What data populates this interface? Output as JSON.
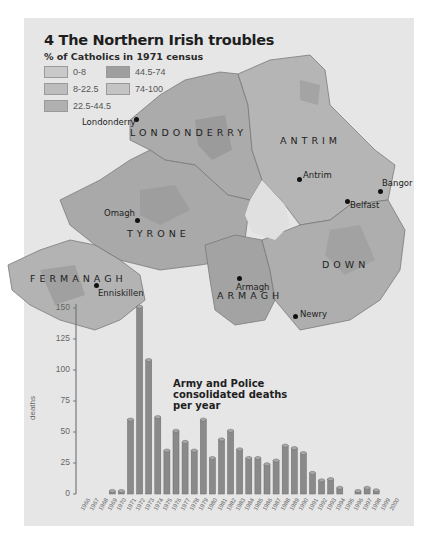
{
  "header": {
    "title": "4 The Northern Irish troubles",
    "subtitle": "% of Catholics in 1971 census"
  },
  "legend": [
    {
      "label": "0-8",
      "color": "#c9c9c9"
    },
    {
      "label": "8-22.5",
      "color": "#bdbdbd"
    },
    {
      "label": "22.5-44.5",
      "color": "#b0b0b0"
    },
    {
      "label": "44.5-74",
      "color": "#9f9f9f"
    },
    {
      "label": "74-100",
      "color": "#c4c4c4"
    }
  ],
  "map": {
    "counties": [
      "LONDONDERRY",
      "ANTRIM",
      "TYRONE",
      "FERMANAGH",
      "ARMAGH",
      "DOWN"
    ],
    "towns": [
      "Londonderry",
      "Antrim",
      "Bangor",
      "Belfast",
      "Omagh",
      "Enniskillen",
      "Armagh",
      "Newry"
    ]
  },
  "chart_data": {
    "type": "bar",
    "title": "Army and Police consolidated deaths per year",
    "xlabel": "",
    "ylabel": "deaths",
    "ylim": [
      0,
      150
    ],
    "yticks": [
      0,
      25,
      50,
      75,
      100,
      125,
      150
    ],
    "grid": false,
    "categories": [
      "1966",
      "1967",
      "1968",
      "1969",
      "1970",
      "1971",
      "1972",
      "1973",
      "1974",
      "1975",
      "1976",
      "1977",
      "1978",
      "1979",
      "1980",
      "1981",
      "1982",
      "1983",
      "1984",
      "1985",
      "1986",
      "1987",
      "1988",
      "1989",
      "1990",
      "1991",
      "1992",
      "1993",
      "1994",
      "1995",
      "1996",
      "1997",
      "1998",
      "1999",
      "2000"
    ],
    "values": [
      0,
      0,
      0,
      2,
      2,
      60,
      151,
      108,
      62,
      35,
      51,
      42,
      35,
      60,
      29,
      44,
      51,
      36,
      29,
      29,
      24,
      27,
      39,
      37,
      33,
      17,
      11,
      12,
      5,
      0,
      2,
      5,
      3,
      0,
      0
    ],
    "bar_color": "#8a8a8a"
  }
}
